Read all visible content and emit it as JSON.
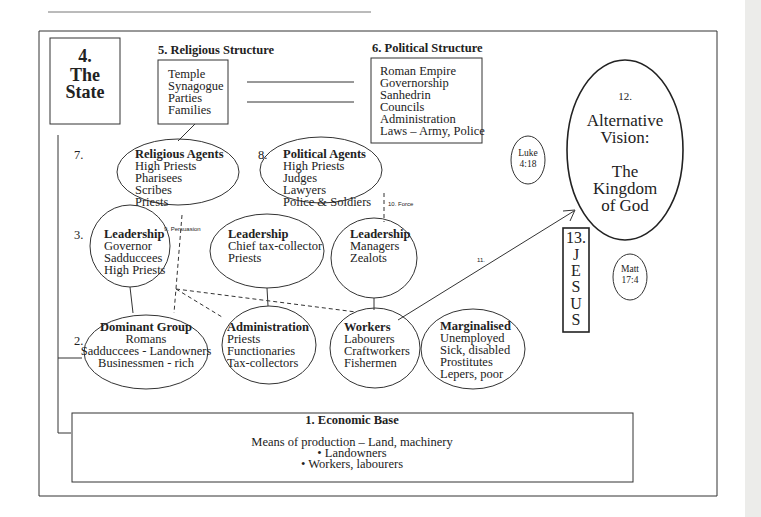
{
  "diagram": {
    "state": {
      "number": "4.",
      "lines": [
        "The",
        "State"
      ]
    },
    "religious_structure": {
      "title": "5. Religious Structure",
      "items": [
        "Temple",
        "Synagogue",
        "Parties",
        "Families"
      ]
    },
    "political_structure": {
      "title": "6. Political Structure",
      "items": [
        "Roman Empire",
        "Governorship",
        "Sanhedrin",
        "Councils",
        "Administration",
        "Laws – Army, Police"
      ]
    },
    "labels": {
      "seven": "7.",
      "eight": "8.",
      "three": "3.",
      "two": "2."
    },
    "religious_agents": {
      "title": "Religious Agents",
      "items": [
        "High Priests",
        "Pharisees",
        "Scribes",
        "Priests"
      ]
    },
    "political_agents": {
      "title": "Political Agents",
      "items": [
        "High Priests",
        "Judges",
        "Lawyers",
        "Police & Soldiers"
      ]
    },
    "leadership_governor": {
      "title": "Leadership",
      "items": [
        "Governor",
        "Sadduccees",
        "High Priests"
      ]
    },
    "leadership_tax": {
      "title": "Leadership",
      "items": [
        "Chief tax-collector",
        "Priests"
      ]
    },
    "leadership_managers": {
      "title": "Leadership",
      "items": [
        "Managers",
        "Zealots"
      ]
    },
    "dominant_group": {
      "title": "Dominant Group",
      "items": [
        "Romans",
        "Sadduccees - Landowners",
        "Businessmen - rich"
      ]
    },
    "administration": {
      "title": "Administration",
      "items": [
        "Priests",
        "Functionaries",
        "Tax-collectors"
      ]
    },
    "workers": {
      "title": "Workers",
      "items": [
        "Labourers",
        "Craftworkers",
        "Fishermen"
      ]
    },
    "marginalised": {
      "title": "Marginalised",
      "items": [
        "Unemployed",
        "Sick, disabled",
        "Prostitutes",
        "Lepers, poor"
      ]
    },
    "connectors": {
      "persuasion": "9. Persuasion",
      "force": "10. Force",
      "eleven": "11."
    },
    "alternative_vision": {
      "number": "12.",
      "lines": [
        "Alternative",
        "Vision:",
        "",
        "The",
        "Kingdom",
        "of God"
      ]
    },
    "jesus": {
      "number": "13.",
      "letters": [
        "J",
        "E",
        "S",
        "U",
        "S"
      ]
    },
    "luke": {
      "lines": [
        "Luke",
        "4:18"
      ]
    },
    "matt": {
      "lines": [
        "Matt",
        "17:4"
      ]
    },
    "economic_base": {
      "title": "1. Economic Base",
      "lines": [
        "Means of production – Land, machinery",
        "• Landowners",
        "• Workers, labourers"
      ]
    }
  }
}
